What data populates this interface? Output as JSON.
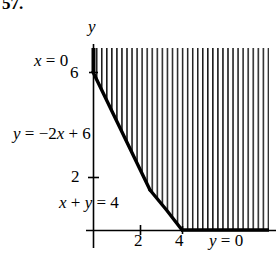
{
  "figure": {
    "exercise_number": "57.",
    "axis_labels": {
      "y_axis": "y",
      "x_axis_equation": "y = 0",
      "y_axis_equation": "x = 0"
    },
    "boundary_labels": {
      "line_a": "y = −2x + 6",
      "line_b": "x + y = 4"
    },
    "ticks": {
      "y": [
        {
          "label": "6",
          "value": 6
        },
        {
          "label": "2",
          "value": 2
        }
      ],
      "x": [
        {
          "label": "2",
          "value": 2
        },
        {
          "label": "4",
          "value": 4
        }
      ]
    },
    "colors": {
      "ink": "#000000",
      "background": "#ffffff",
      "hatch": "#1a1a1a"
    }
  },
  "chart_data": {
    "type": "line",
    "title": "57.",
    "xlabel": "",
    "ylabel": "",
    "xlim": [
      -1,
      7.5
    ],
    "ylim": [
      -1,
      8
    ],
    "grid": false,
    "legend": "none",
    "x_ticks": [
      2,
      4
    ],
    "x_tick_labels": [
      "2",
      "4"
    ],
    "y_ticks": [
      2,
      6
    ],
    "y_tick_labels": [
      "2",
      "6"
    ],
    "series": [
      {
        "name": "y = -2x + 6",
        "annotation": "y = −2x + 6",
        "points": [
          [
            0,
            6
          ],
          [
            2,
            2
          ]
        ],
        "style": "solid-thick"
      },
      {
        "name": "x + y = 4",
        "annotation": "x + y = 4",
        "points": [
          [
            2,
            2
          ],
          [
            4,
            0
          ]
        ],
        "style": "solid-thick"
      },
      {
        "name": "y = 0",
        "annotation": "y = 0",
        "points": [
          [
            4,
            0
          ],
          [
            7.2,
            0
          ]
        ],
        "style": "solid-thick"
      },
      {
        "name": "x = 0",
        "annotation": "x = 0",
        "points": [
          [
            0,
            6
          ],
          [
            0,
            8
          ]
        ],
        "style": "solid-thick"
      }
    ],
    "shaded_region": {
      "description": "vertical hatching above and right of the boundary",
      "hatch": "vertical-lines",
      "vertices": [
        [
          0,
          6
        ],
        [
          2,
          2
        ],
        [
          4,
          0
        ],
        [
          7.2,
          0
        ],
        [
          7.2,
          8
        ],
        [
          0,
          8
        ]
      ]
    },
    "annotations": [
      {
        "text": "x = 0",
        "x": 0,
        "y": 7.0
      },
      {
        "text": "y = −2x + 6",
        "x": 0,
        "y": 3.7
      },
      {
        "text": "x + y = 4",
        "x": 0.6,
        "y": 0.8
      },
      {
        "text": "y = 0",
        "x": 5.6,
        "y": -0.6
      },
      {
        "text": "y",
        "x": 0,
        "y": 8.2
      }
    ]
  }
}
